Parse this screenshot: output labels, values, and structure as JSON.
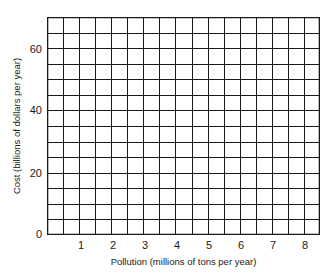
{
  "chart_data": {
    "type": "line",
    "title": "",
    "xlabel": "Pollution (millions of tons per year)",
    "ylabel": "Cost (billions of dollars per year)",
    "x_ticks": [
      "1",
      "2",
      "3",
      "4",
      "5",
      "6",
      "7",
      "8"
    ],
    "y_ticks": [
      "0",
      "20",
      "40",
      "60"
    ],
    "xlim": [
      0,
      8.5
    ],
    "ylim": [
      0,
      70
    ],
    "grid": true,
    "grid_columns": 17,
    "grid_rows": 14,
    "series": [],
    "note": "Blank graph grid with no plotted data"
  },
  "colors": {
    "grid": "#1a1a1a",
    "background": "#ffffff"
  }
}
